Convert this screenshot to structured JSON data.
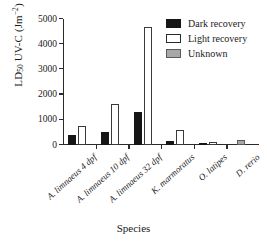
{
  "chart_data": {
    "type": "bar",
    "title": "",
    "xlabel": "Species",
    "ylabel": "LD50 UV-C (Jm-2)",
    "ylabel_parts": {
      "main": "LD",
      "sub": "50",
      "mid": " UV-C (Jm",
      "sup": "−2",
      "tail": ")"
    },
    "categories": [
      "A. limnaeus 4 dpf",
      "A. limnaeus 10 dpf",
      "A. limnaeus 32 dpf",
      "K. marmoratus",
      "O. latipes",
      "D. rerio"
    ],
    "series": [
      {
        "name": "Dark recovery",
        "color": "#161616",
        "values": [
          400,
          510,
          1320,
          175,
          55,
          null
        ]
      },
      {
        "name": "Light recovery",
        "color": "#ffffff",
        "values": [
          750,
          1610,
          4680,
          580,
          130,
          null
        ]
      },
      {
        "name": "Unknown",
        "color": "#a8a8a8",
        "values": [
          null,
          null,
          null,
          null,
          null,
          180
        ]
      }
    ],
    "ylim": [
      0,
      5000
    ],
    "yticks": [
      0,
      1000,
      2000,
      3000,
      4000,
      5000
    ],
    "ytick_labels": [
      "0",
      "1000",
      "2000",
      "3000",
      "4000",
      "5000"
    ],
    "grid": false,
    "legend_position": "top-right"
  },
  "legend": {
    "entries": [
      {
        "label": "Dark recovery",
        "style": "dark"
      },
      {
        "label": "Light recovery",
        "style": "light"
      },
      {
        "label": "Unknown",
        "style": "unknown"
      }
    ]
  }
}
